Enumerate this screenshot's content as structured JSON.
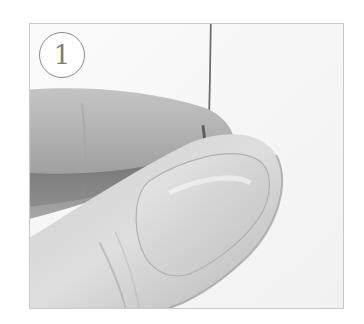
{
  "step": {
    "number": "1"
  },
  "photo": {
    "subject": "fingers-holding-wire",
    "tone": "grayscale",
    "colors": {
      "frame_border": "#c9c9c9",
      "background": "#f7f7f7",
      "badge_stroke": "#8a8a8a",
      "wire": "#6e6e6e"
    }
  }
}
